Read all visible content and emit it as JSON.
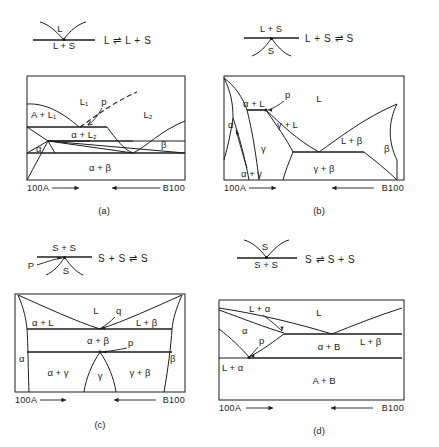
{
  "figure": {
    "panels": [
      {
        "id": "a",
        "caption": "(a)",
        "inset": {
          "equation": "L ⇌ L + S",
          "top_label": "L",
          "bottom_label": "L + S",
          "point_label": ""
        },
        "diagram": {
          "left_axis_label": "100A",
          "right_axis_label": "B100",
          "regions": [
            {
              "name": "A + L1",
              "text": "A + L₁"
            },
            {
              "name": "L1",
              "text": "L₁"
            },
            {
              "name": "L2",
              "text": "L₂"
            },
            {
              "name": "point-p",
              "text": "p"
            },
            {
              "name": "alpha-plus-L2",
              "text": "α + L₂"
            },
            {
              "name": "alpha",
              "text": "α"
            },
            {
              "name": "beta",
              "text": "β"
            },
            {
              "name": "alpha-plus-beta",
              "text": "α + β"
            }
          ]
        }
      },
      {
        "id": "b",
        "caption": "(b)",
        "inset": {
          "equation": "L + S ⇌ S",
          "top_label": "L + S",
          "bottom_label": "S",
          "point_label": ""
        },
        "diagram": {
          "left_axis_label": "100A",
          "right_axis_label": "B100",
          "regions": [
            {
              "name": "alpha-plus-L",
              "text": "α + L"
            },
            {
              "name": "point-p",
              "text": "p"
            },
            {
              "name": "liquid",
              "text": "L"
            },
            {
              "name": "alpha",
              "text": "α"
            },
            {
              "name": "gamma-plus-L",
              "text": "γ + L"
            },
            {
              "name": "L-plus-beta",
              "text": "L + β"
            },
            {
              "name": "beta",
              "text": "β"
            },
            {
              "name": "gamma",
              "text": "γ"
            },
            {
              "name": "alpha-plus-gamma",
              "text": "α + γ"
            },
            {
              "name": "gamma-plus-beta",
              "text": "γ + β"
            }
          ]
        }
      },
      {
        "id": "c",
        "caption": "(c)",
        "inset": {
          "equation": "S + S ⇌ S",
          "top_label": "S + S",
          "bottom_label": "S",
          "point_label": "P"
        },
        "diagram": {
          "left_axis_label": "100A",
          "right_axis_label": "B100",
          "regions": [
            {
              "name": "liquid",
              "text": "L"
            },
            {
              "name": "point-q",
              "text": "q"
            },
            {
              "name": "alpha-plus-L",
              "text": "α + L"
            },
            {
              "name": "L-plus-beta",
              "text": "L + β"
            },
            {
              "name": "alpha-plus-beta",
              "text": "α + β"
            },
            {
              "name": "point-p",
              "text": "p"
            },
            {
              "name": "alpha",
              "text": "α"
            },
            {
              "name": "beta",
              "text": "β"
            },
            {
              "name": "alpha-plus-gamma",
              "text": "α + γ"
            },
            {
              "name": "gamma",
              "text": "γ"
            },
            {
              "name": "gamma-plus-beta",
              "text": "γ + β"
            }
          ]
        }
      },
      {
        "id": "d",
        "caption": "(d)",
        "inset": {
          "equation": "S ⇌ S + S",
          "top_label": "S",
          "bottom_label": "S + S",
          "point_label": ""
        },
        "diagram": {
          "left_axis_label": "100A",
          "right_axis_label": "B100",
          "regions": [
            {
              "name": "L-plus-alpha-top",
              "text": "L + α"
            },
            {
              "name": "liquid",
              "text": "L"
            },
            {
              "name": "alpha",
              "text": "α"
            },
            {
              "name": "point-p",
              "text": "p"
            },
            {
              "name": "L-plus-beta",
              "text": "L + β"
            },
            {
              "name": "alpha-plus-B",
              "text": "α + B"
            },
            {
              "name": "L-plus-alpha-left",
              "text": "L + α"
            },
            {
              "name": "A-plus-B",
              "text": "A + B"
            }
          ]
        }
      }
    ]
  }
}
